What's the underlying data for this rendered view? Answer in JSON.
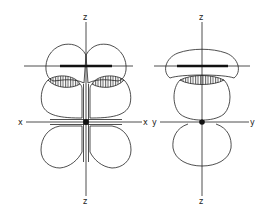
{
  "figure": {
    "left_panel": {
      "axis_labels": {
        "z_top": "z",
        "z_bottom": "z",
        "x_left": "x",
        "x_right": "x"
      }
    },
    "right_panel": {
      "axis_labels": {
        "z_top": "z",
        "z_bottom": "z",
        "y_left": "y",
        "y_right": "y"
      }
    },
    "colors": {
      "line": "#222222",
      "background": "#ffffff"
    }
  }
}
